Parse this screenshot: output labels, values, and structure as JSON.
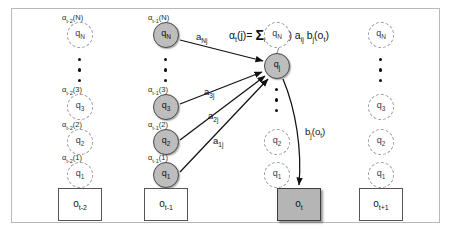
{
  "figure": {
    "equation": {
      "lhs": "α",
      "full": "αt(j)= Σi αt-1(i) aij bj(ot)",
      "parts": {
        "alpha": "α",
        "t": "t",
        "j_arg": "(j)=",
        "sigma": "Σ",
        "i": "i",
        "alpha2": "α",
        "tm1": "t-1",
        "i_arg": "(i)",
        "a": "a",
        "ij": "ij",
        "b": "b",
        "j": "j",
        "ot_open": "(o",
        "ot_sub": "t",
        "ot_close": ")"
      }
    },
    "colors": {
      "solid_node_fill": "#bdbdbd",
      "solid_node_border": "#4a4a4a",
      "ghost_node_border": "#9a9a9a",
      "shaded_box_fill": "#b5b5b5",
      "frame_border": "#b9b9b9",
      "edge": "#1a1a1a",
      "text": "#111111"
    },
    "columns": [
      {
        "id": "col-t-2",
        "observation": {
          "base": "o",
          "sub": "t-2",
          "shaded": false
        },
        "node_style": "ghost",
        "has_alpha_labels": true,
        "alpha_prefix": "t-2",
        "nodes": [
          {
            "base": "q",
            "sub": "N",
            "alpha": {
              "alpha": "α",
              "sub": "t-2",
              "arg": "(N)"
            }
          },
          {
            "base": "q",
            "sub": "3",
            "alpha": {
              "alpha": "α",
              "sub": "t-2",
              "arg": "(3)"
            }
          },
          {
            "base": "q",
            "sub": "2",
            "alpha": {
              "alpha": "α",
              "sub": "t-2",
              "arg": "(2)"
            }
          },
          {
            "base": "q",
            "sub": "1",
            "alpha": {
              "alpha": "α",
              "sub": "t-2",
              "arg": "(1)"
            }
          }
        ]
      },
      {
        "id": "col-t-1",
        "observation": {
          "base": "o",
          "sub": "t-1",
          "shaded": false
        },
        "node_style": "solid",
        "has_alpha_labels": true,
        "alpha_prefix": "t-1",
        "nodes": [
          {
            "base": "q",
            "sub": "N",
            "alpha": {
              "alpha": "α",
              "sub": "t-1",
              "arg": "(N)"
            }
          },
          {
            "base": "q",
            "sub": "3",
            "alpha": {
              "alpha": "α",
              "sub": "t-1",
              "arg": "(3)"
            }
          },
          {
            "base": "q",
            "sub": "2",
            "alpha": {
              "alpha": "α",
              "sub": "t-1",
              "arg": "(2)"
            }
          },
          {
            "base": "q",
            "sub": "1",
            "alpha": {
              "alpha": "α",
              "sub": "t-1",
              "arg": "(1)"
            }
          }
        ]
      },
      {
        "id": "col-t",
        "observation": {
          "base": "o",
          "sub": "t",
          "shaded": true
        },
        "node_style": "mixed",
        "has_alpha_labels": false,
        "nodes": [
          {
            "base": "q",
            "sub": "N",
            "style": "ghost"
          },
          {
            "base": "q",
            "sub": "j",
            "style": "solid"
          },
          {
            "base": "q",
            "sub": "2",
            "style": "ghost"
          },
          {
            "base": "q",
            "sub": "1",
            "style": "ghost"
          }
        ]
      },
      {
        "id": "col-t+1",
        "observation": {
          "base": "o",
          "sub": "t+1",
          "shaded": false
        },
        "node_style": "ghost",
        "has_alpha_labels": false,
        "nodes": [
          {
            "base": "q",
            "sub": "N"
          },
          {
            "base": "q",
            "sub": "3"
          },
          {
            "base": "q",
            "sub": "2"
          },
          {
            "base": "q",
            "sub": "1"
          }
        ]
      }
    ],
    "edge_labels": [
      {
        "id": "a-Nj",
        "base": "a",
        "sub": "Nj"
      },
      {
        "id": "a-3j",
        "base": "a",
        "sub": "3j"
      },
      {
        "id": "a-2j",
        "base": "a",
        "sub": "2j"
      },
      {
        "id": "a-1j",
        "base": "a",
        "sub": "1j"
      },
      {
        "id": "b-j-ot",
        "base": "b",
        "sub": "j",
        "arg_open": "(o",
        "arg_sub": "t",
        "arg_close": ")"
      }
    ]
  }
}
